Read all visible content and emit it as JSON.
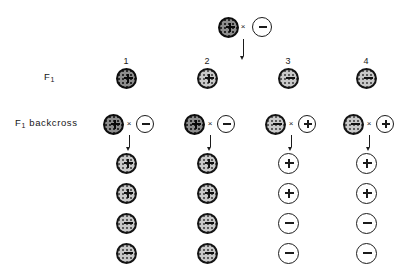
{
  "figure": {
    "type": "genetics-cross-diagram",
    "title_visible": false,
    "rows": {
      "parental_label": "",
      "f1_label_main": "F",
      "f1_label_sub": "1",
      "backcross_label_main": "F",
      "backcross_label_sub": "1",
      "backcross_label_rest": "backcross"
    },
    "symbols": {
      "cross": "×",
      "plus": "+",
      "minus": "−"
    },
    "colors": {
      "ink": "#1b1b1b",
      "stipple_light": "#c9c9c9",
      "stipple_dark": "#8d8d8d",
      "open_fill": "#ffffff"
    }
  },
  "parental_cross": {
    "left": {
      "sign": "+",
      "fill": "stipple-dark"
    },
    "operator": "×",
    "right": {
      "sign": "−",
      "fill": "open"
    },
    "arrow": "down"
  },
  "f1": {
    "label_main": "F",
    "label_sub": "1",
    "column_numbers": [
      "1",
      "2",
      "3",
      "4"
    ],
    "individuals": [
      {
        "number": "1",
        "sign": "+",
        "fill": "stipple-dark"
      },
      {
        "number": "2",
        "sign": "+",
        "fill": "stipple"
      },
      {
        "number": "3",
        "sign": "−",
        "fill": "stipple"
      },
      {
        "number": "4",
        "sign": "−",
        "fill": "stipple"
      }
    ]
  },
  "backcross": {
    "label_main": "F",
    "label_sub": "1",
    "label_rest": "backcross",
    "operator": "×",
    "pairs": [
      {
        "column": "1",
        "parent": {
          "sign": "+",
          "fill": "stipple-dark"
        },
        "tester": {
          "sign": "−",
          "fill": "open"
        },
        "arrow": "down"
      },
      {
        "column": "2",
        "parent": {
          "sign": "+",
          "fill": "stipple-dark"
        },
        "tester": {
          "sign": "−",
          "fill": "open"
        },
        "arrow": "down"
      },
      {
        "column": "3",
        "parent": {
          "sign": "−",
          "fill": "stipple"
        },
        "tester": {
          "sign": "+",
          "fill": "open"
        },
        "arrow": "down"
      },
      {
        "column": "4",
        "parent": {
          "sign": "−",
          "fill": "stipple"
        },
        "tester": {
          "sign": "+",
          "fill": "open"
        },
        "arrow": "down"
      }
    ]
  },
  "offspring": {
    "rows_per_column": 4,
    "columns": [
      {
        "column": "1",
        "progeny": [
          {
            "sign": "+",
            "fill": "stipple"
          },
          {
            "sign": "+",
            "fill": "stipple"
          },
          {
            "sign": "−",
            "fill": "stipple"
          },
          {
            "sign": "−",
            "fill": "stipple"
          }
        ]
      },
      {
        "column": "2",
        "progeny": [
          {
            "sign": "+",
            "fill": "stipple"
          },
          {
            "sign": "+",
            "fill": "stipple"
          },
          {
            "sign": "−",
            "fill": "stipple"
          },
          {
            "sign": "−",
            "fill": "stipple"
          }
        ]
      },
      {
        "column": "3",
        "progeny": [
          {
            "sign": "+",
            "fill": "open"
          },
          {
            "sign": "+",
            "fill": "open"
          },
          {
            "sign": "−",
            "fill": "open"
          },
          {
            "sign": "−",
            "fill": "open"
          }
        ]
      },
      {
        "column": "4",
        "progeny": [
          {
            "sign": "+",
            "fill": "open"
          },
          {
            "sign": "+",
            "fill": "open"
          },
          {
            "sign": "−",
            "fill": "open"
          },
          {
            "sign": "−",
            "fill": "open"
          }
        ]
      }
    ]
  },
  "layout": {
    "column_x": [
      126,
      207,
      288,
      366
    ],
    "parental_center_x": 243,
    "parental_y": 27,
    "f1_number_y": 56,
    "f1_y": 78,
    "backcross_y": 124,
    "offspring_start_y": 163,
    "offspring_step_y": 30,
    "circle_diameter_large": 21,
    "circle_diameter_small": 18
  }
}
